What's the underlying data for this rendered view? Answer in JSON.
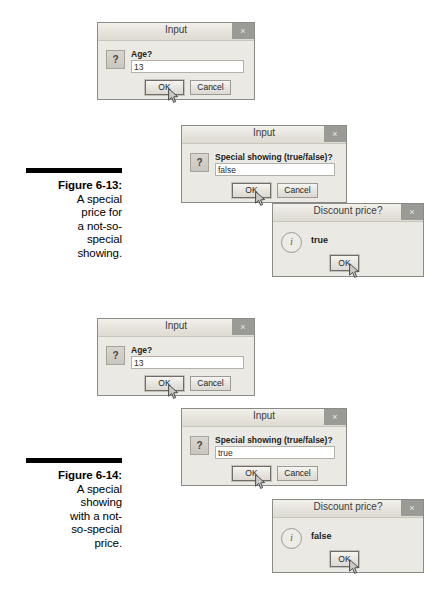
{
  "figures": [
    {
      "id": "figure-6-13",
      "label": "Figure 6-13:",
      "caption_lines": [
        "A special",
        "price for",
        "a not-so-",
        "special",
        "showing."
      ]
    },
    {
      "id": "figure-6-14",
      "label": "Figure 6-14:",
      "caption_lines": [
        "A special",
        "showing",
        "with a not-",
        "so-special",
        "price."
      ]
    }
  ],
  "dialogs": [
    {
      "id": "input-age-1",
      "title": "Input",
      "close_label": "×",
      "icon": "question-icon",
      "field_label": "Age?",
      "field_value": "13",
      "ok_label": "OK",
      "cancel_label": "Cancel"
    },
    {
      "id": "input-special-showing-1",
      "title": "Input",
      "close_label": "×",
      "icon": "question-icon",
      "field_label": "Special showing (true/false)?",
      "field_value": "false",
      "ok_label": "OK",
      "cancel_label": "Cancel"
    },
    {
      "id": "discount-price-1",
      "title": "Discount price?",
      "close_label": "×",
      "icon": "info-icon",
      "message": "true",
      "ok_label": "OK"
    },
    {
      "id": "input-age-2",
      "title": "Input",
      "close_label": "×",
      "icon": "question-icon",
      "field_label": "Age?",
      "field_value": "13",
      "ok_label": "OK",
      "cancel_label": "Cancel"
    },
    {
      "id": "input-special-showing-2",
      "title": "Input",
      "close_label": "×",
      "icon": "question-icon",
      "field_label": "Special showing (true/false)?",
      "field_value": "true",
      "ok_label": "OK",
      "cancel_label": "Cancel"
    },
    {
      "id": "discount-price-2",
      "title": "Discount price?",
      "close_label": "×",
      "icon": "info-icon",
      "message": "false",
      "ok_label": "OK"
    }
  ],
  "icons": {
    "question_glyph": "?",
    "info_glyph": "i"
  },
  "colors": {
    "dialog_face": "#eceae4",
    "titlebar": "#e6e3dc",
    "close_button": "#9a9a96",
    "rule": "#000000"
  }
}
